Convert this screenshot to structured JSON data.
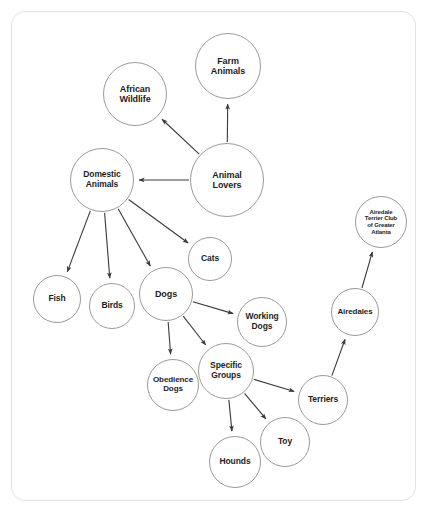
{
  "diagram": {
    "background": "#ffffff",
    "frame_color": "#e3e3e3",
    "node_stroke": "#9a9a9a",
    "edge_color": "#3a3a3a",
    "text_color": "#1d1d1d",
    "nodes": [
      {
        "id": "farm_animals",
        "label": "Farm\nAnimals",
        "cx": 228,
        "cy": 66,
        "r": 33,
        "font": 9
      },
      {
        "id": "african_wildlife",
        "label": "African\nWildlife",
        "cx": 135,
        "cy": 94,
        "r": 32,
        "font": 9
      },
      {
        "id": "animal_lovers",
        "label": "Animal\nLovers",
        "cx": 227,
        "cy": 180,
        "r": 37,
        "font": 9
      },
      {
        "id": "domestic_animals",
        "label": "Domestic\nAnimals",
        "cx": 102,
        "cy": 180,
        "r": 32,
        "font": 8.5
      },
      {
        "id": "atc_atlanta",
        "label": "Airedale\nTerrier Club\nof Greater\nAtlanta",
        "cx": 381,
        "cy": 222,
        "r": 26,
        "font": 6
      },
      {
        "id": "cats",
        "label": "Cats",
        "cx": 210,
        "cy": 259,
        "r": 22,
        "font": 8.5
      },
      {
        "id": "fish",
        "label": "Fish",
        "cx": 57,
        "cy": 299,
        "r": 24,
        "font": 8.5
      },
      {
        "id": "birds",
        "label": "Birds",
        "cx": 112,
        "cy": 306,
        "r": 23,
        "font": 8.5
      },
      {
        "id": "dogs",
        "label": "Dogs",
        "cx": 166,
        "cy": 294,
        "r": 27,
        "font": 9
      },
      {
        "id": "working_dogs",
        "label": "Working\nDogs",
        "cx": 262,
        "cy": 322,
        "r": 25,
        "font": 8.5
      },
      {
        "id": "airedales",
        "label": "Airedales",
        "cx": 355,
        "cy": 312,
        "r": 24,
        "font": 8
      },
      {
        "id": "obedience_dogs",
        "label": "Obedience\nDogs",
        "cx": 173,
        "cy": 385,
        "r": 26,
        "font": 8
      },
      {
        "id": "specific_groups",
        "label": "Specific\nGroups",
        "cx": 226,
        "cy": 371,
        "r": 28,
        "font": 8.5
      },
      {
        "id": "terriers",
        "label": "Terriers",
        "cx": 323,
        "cy": 400,
        "r": 25,
        "font": 8.5
      },
      {
        "id": "toy",
        "label": "Toy",
        "cx": 285,
        "cy": 442,
        "r": 25,
        "font": 8.5
      },
      {
        "id": "hounds",
        "label": "Hounds",
        "cx": 235,
        "cy": 462,
        "r": 26,
        "font": 8.5
      }
    ],
    "edges": [
      {
        "from": "animal_lovers",
        "to": "farm_animals"
      },
      {
        "from": "animal_lovers",
        "to": "african_wildlife"
      },
      {
        "from": "animal_lovers",
        "to": "domestic_animals"
      },
      {
        "from": "domestic_animals",
        "to": "fish"
      },
      {
        "from": "domestic_animals",
        "to": "birds"
      },
      {
        "from": "domestic_animals",
        "to": "dogs"
      },
      {
        "from": "domestic_animals",
        "to": "cats"
      },
      {
        "from": "dogs",
        "to": "working_dogs"
      },
      {
        "from": "dogs",
        "to": "obedience_dogs"
      },
      {
        "from": "dogs",
        "to": "specific_groups"
      },
      {
        "from": "specific_groups",
        "to": "terriers"
      },
      {
        "from": "specific_groups",
        "to": "toy"
      },
      {
        "from": "specific_groups",
        "to": "hounds"
      },
      {
        "from": "terriers",
        "to": "airedales"
      },
      {
        "from": "airedales",
        "to": "atc_atlanta"
      }
    ]
  }
}
